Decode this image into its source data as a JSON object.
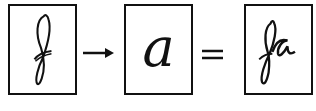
{
  "diagram": {
    "items": [
      {
        "id": "box-1",
        "content": "f",
        "style": "cursive looped f"
      },
      {
        "id": "box-2",
        "content": "a",
        "style": "italic a"
      },
      {
        "id": "box-3",
        "content": "fa",
        "style": "cursive joined fa"
      }
    ],
    "operators": [
      {
        "between": [
          "box-1",
          "box-2"
        ],
        "symbol": "→",
        "meaning": "followed by"
      },
      {
        "between": [
          "box-2",
          "box-3"
        ],
        "symbol": "=",
        "meaning": "equals"
      }
    ],
    "colors": {
      "ink": "#111111",
      "background": "#ffffff"
    }
  }
}
